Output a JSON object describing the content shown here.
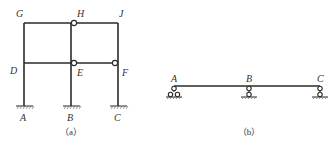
{
  "figure_a": {
    "caption": "（a）",
    "node_labels": {
      "G": "G",
      "H": "H",
      "J": "J",
      "D": "D",
      "E": "E",
      "F": "F",
      "A": "A",
      "B": "B",
      "C": "C"
    },
    "hinges": [
      "H",
      "E",
      "F"
    ],
    "supports": [
      "A: fixed",
      "B: fixed",
      "C: fixed"
    ]
  },
  "figure_b": {
    "caption": "（b）",
    "node_labels": {
      "A": "A",
      "B": "B",
      "C": "C"
    },
    "supports": [
      "A: roller",
      "B: pin",
      "C: pin"
    ]
  },
  "colors": {
    "line": "#2a2a2a",
    "text": "#333333",
    "background": "#ffffff"
  }
}
